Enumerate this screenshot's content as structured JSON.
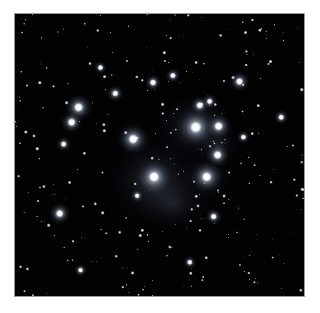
{
  "page": {
    "background_color": "#ffffff",
    "width": 320,
    "height": 313
  },
  "figure": {
    "name": "pleiades-star-cluster-photograph",
    "frame": {
      "x": 14,
      "y": 13,
      "width": 291,
      "height": 284,
      "border_color": "#9a9a9a",
      "border_width": 1
    },
    "sky_background_color": "#020203",
    "star_color": "#ffffff",
    "nebula_color": "#8fa6c8",
    "caption": ""
  },
  "chart_data": {
    "type": "scatter",
    "xlabel": "",
    "ylabel": "",
    "xlim": [
      0,
      291
    ],
    "ylim": [
      0,
      284
    ],
    "grid": false,
    "legend": "none",
    "nebulae": [
      {
        "x": 182,
        "y": 114,
        "rx": 44,
        "ry": 40,
        "opacity": 0.3,
        "name": "alcyone-reflection-nebula"
      },
      {
        "x": 140,
        "y": 168,
        "rx": 52,
        "ry": 50,
        "opacity": 0.3,
        "name": "merope-nebula"
      },
      {
        "x": 193,
        "y": 164,
        "rx": 32,
        "ry": 28,
        "opacity": 0.2,
        "name": "maia-reflection-nebula"
      },
      {
        "x": 119,
        "y": 126,
        "rx": 24,
        "ry": 22,
        "opacity": 0.17,
        "name": "electra-reflection-nebula"
      },
      {
        "x": 160,
        "y": 190,
        "rx": 46,
        "ry": 36,
        "opacity": 0.16,
        "name": "lower-nebulosity"
      },
      {
        "x": 204,
        "y": 132,
        "rx": 26,
        "ry": 24,
        "opacity": 0.16,
        "name": "atlas-glow"
      }
    ],
    "bright_stars": [
      {
        "x": 182,
        "y": 114,
        "r": 6.0,
        "glow": 20,
        "name": "alcyone"
      },
      {
        "x": 140,
        "y": 164,
        "r": 5.6,
        "glow": 19,
        "name": "merope"
      },
      {
        "x": 193,
        "y": 164,
        "r": 5.2,
        "glow": 17,
        "name": "maia"
      },
      {
        "x": 119,
        "y": 126,
        "r": 5.0,
        "glow": 16,
        "name": "electra"
      },
      {
        "x": 205,
        "y": 113,
        "r": 4.6,
        "glow": 14,
        "name": "atlas"
      },
      {
        "x": 204,
        "y": 142,
        "r": 4.4,
        "glow": 13,
        "name": "taygeta"
      },
      {
        "x": 64,
        "y": 94,
        "r": 4.8,
        "glow": 15,
        "name": "asterope"
      },
      {
        "x": 57,
        "y": 109,
        "r": 4.2,
        "glow": 12,
        "name": "pleione"
      },
      {
        "x": 186,
        "y": 92,
        "r": 3.6,
        "glow": 10,
        "name": "celaeno"
      },
      {
        "x": 196,
        "y": 88,
        "r": 3.0,
        "glow": 8,
        "name": "bright-field-star-a"
      },
      {
        "x": 226,
        "y": 68,
        "r": 3.8,
        "glow": 11,
        "name": "bright-field-star-b"
      },
      {
        "x": 45,
        "y": 201,
        "r": 4.0,
        "glow": 12,
        "name": "bright-field-star-c"
      },
      {
        "x": 139,
        "y": 69,
        "r": 3.4,
        "glow": 9,
        "name": "bright-field-star-d"
      },
      {
        "x": 101,
        "y": 80,
        "r": 3.2,
        "glow": 9,
        "name": "bright-field-star-e"
      },
      {
        "x": 159,
        "y": 62,
        "r": 3.0,
        "glow": 8,
        "name": "bright-field-star-f"
      },
      {
        "x": 200,
        "y": 204,
        "r": 3.2,
        "glow": 9,
        "name": "bright-field-star-g"
      },
      {
        "x": 49,
        "y": 131,
        "r": 3.0,
        "glow": 8,
        "name": "bright-field-star-h"
      },
      {
        "x": 268,
        "y": 104,
        "r": 3.0,
        "glow": 8,
        "name": "bright-field-star-i"
      },
      {
        "x": 230,
        "y": 124,
        "r": 2.8,
        "glow": 7,
        "name": "bright-field-star-j"
      },
      {
        "x": 86,
        "y": 54,
        "r": 2.8,
        "glow": 7,
        "name": "bright-field-star-k"
      },
      {
        "x": 123,
        "y": 183,
        "r": 2.6,
        "glow": 7,
        "name": "bright-field-star-l"
      },
      {
        "x": 176,
        "y": 250,
        "r": 2.8,
        "glow": 7,
        "name": "bright-field-star-m"
      },
      {
        "x": 66,
        "y": 258,
        "r": 2.6,
        "glow": 7,
        "name": "bright-field-star-n"
      }
    ],
    "field_star_count": 430,
    "field_star_seed": 20240517
  }
}
